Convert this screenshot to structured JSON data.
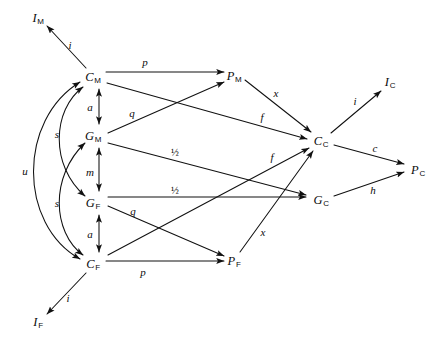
{
  "diagram": {
    "type": "node-link-diagram",
    "background": "#ffffff",
    "stroke_color": "#111111",
    "width": 440,
    "height": 342,
    "nodes": [
      {
        "id": "I_M",
        "base": "I",
        "sub": "M",
        "x": 38,
        "y": 18
      },
      {
        "id": "C_M",
        "base": "C",
        "sub": "M",
        "x": 93,
        "y": 77
      },
      {
        "id": "G_M",
        "base": "G",
        "sub": "M",
        "x": 93,
        "y": 136
      },
      {
        "id": "G_F",
        "base": "G",
        "sub": "F",
        "x": 93,
        "y": 203
      },
      {
        "id": "C_F",
        "base": "C",
        "sub": "F",
        "x": 93,
        "y": 264
      },
      {
        "id": "I_F",
        "base": "I",
        "sub": "F",
        "x": 38,
        "y": 322
      },
      {
        "id": "P_M",
        "base": "P",
        "sub": "M",
        "x": 234,
        "y": 76
      },
      {
        "id": "P_F",
        "base": "P",
        "sub": "F",
        "x": 234,
        "y": 261
      },
      {
        "id": "C_C",
        "base": "C",
        "sub": "C",
        "x": 321,
        "y": 141
      },
      {
        "id": "G_C",
        "base": "G",
        "sub": "C",
        "x": 321,
        "y": 200
      },
      {
        "id": "I_C",
        "base": "I",
        "sub": "C",
        "x": 390,
        "y": 82
      },
      {
        "id": "P_C",
        "base": "P",
        "sub": "C",
        "x": 418,
        "y": 170
      }
    ],
    "edges": [
      {
        "from": "C_M",
        "to": "I_M",
        "label": "i",
        "label_x": 70,
        "label_y": 45
      },
      {
        "from": "C_F",
        "to": "I_F",
        "label": "i",
        "label_x": 68,
        "label_y": 298
      },
      {
        "from": "C_C",
        "to": "I_C",
        "label": "i",
        "label_x": 355,
        "label_y": 101
      },
      {
        "from": "C_M",
        "to": "P_M",
        "label": "p",
        "label_x": 145,
        "label_y": 62
      },
      {
        "from": "C_F",
        "to": "P_F",
        "label": "p",
        "label_x": 143,
        "label_y": 272
      },
      {
        "from": "G_M",
        "to": "P_M",
        "label": "q",
        "label_x": 132,
        "label_y": 113
      },
      {
        "from": "G_F",
        "to": "P_F",
        "label": "q",
        "label_x": 133,
        "label_y": 211
      },
      {
        "from": "G_M",
        "to": "G_C",
        "label": "½",
        "label_x": 175,
        "label_y": 152
      },
      {
        "from": "G_F",
        "to": "G_C",
        "label": "½",
        "label_x": 175,
        "label_y": 190
      },
      {
        "from": "C_M",
        "to": "C_C",
        "label": "f",
        "label_x": 262,
        "label_y": 117
      },
      {
        "from": "C_F",
        "to": "C_C",
        "label": "f",
        "label_x": 272,
        "label_y": 157
      },
      {
        "from": "P_M",
        "to": "C_C",
        "label": "x",
        "label_x": 276,
        "label_y": 93
      },
      {
        "from": "P_F",
        "to": "C_C",
        "label": "x",
        "label_x": 263,
        "label_y": 232
      },
      {
        "from": "C_C",
        "to": "P_C",
        "label": "c",
        "label_x": 375,
        "label_y": 148
      },
      {
        "from": "G_C",
        "to": "P_C",
        "label": "h",
        "label_x": 373,
        "label_y": 190
      },
      {
        "from": "C_M",
        "to": "G_M",
        "label": "a",
        "label_x": 90,
        "label_y": 107,
        "bidirectional": true
      },
      {
        "from": "G_M",
        "to": "G_F",
        "label": "m",
        "label_x": 90,
        "label_y": 172,
        "bidirectional": true
      },
      {
        "from": "G_F",
        "to": "C_F",
        "label": "a",
        "label_x": 90,
        "label_y": 234,
        "bidirectional": true
      },
      {
        "from": "G_F",
        "to": "C_M",
        "label": "s",
        "label_x": 57,
        "label_y": 134,
        "bidirectional": true,
        "curved": true
      },
      {
        "from": "G_M",
        "to": "C_F",
        "label": "s",
        "label_x": 57,
        "label_y": 203,
        "bidirectional": true,
        "curved": true
      },
      {
        "from": "C_M",
        "to": "C_F",
        "label": "u",
        "label_x": 25,
        "label_y": 171,
        "bidirectional": true,
        "curved": true
      }
    ]
  }
}
